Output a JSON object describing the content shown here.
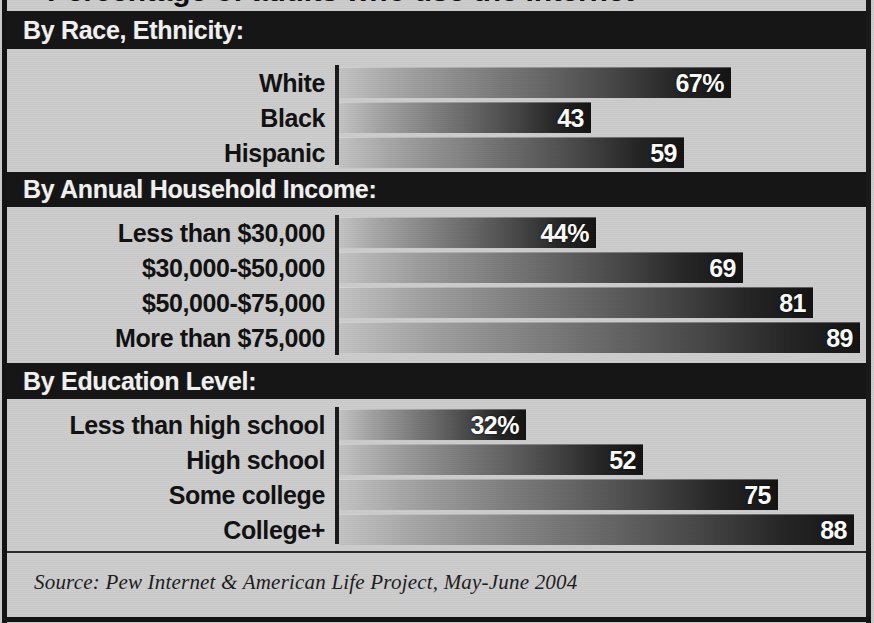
{
  "title": "Percentage of adults who use the Internet",
  "sections": [
    {
      "id": "race",
      "header": "By Race, Ethnicity:"
    },
    {
      "id": "income",
      "header": "By Annual Household Income:"
    },
    {
      "id": "education",
      "header": "By Education Level:"
    }
  ],
  "source": "Source: Pew Internet & American Life Project, May-June 2004",
  "colors": {
    "panel_background": "#cdcdcd",
    "band_background": "#161616",
    "band_text": "#f2f2f2",
    "label_text": "#121212",
    "bar_gradient_start": "#c4c4c4",
    "bar_gradient_end": "#141414",
    "bar_value_text": "#ffffff",
    "axis": "#1b1b1b"
  },
  "chart_data": {
    "type": "bar",
    "title": "Percentage of adults who use the Internet",
    "xlabel": "",
    "ylabel": "",
    "xlim": [
      0,
      100
    ],
    "grid": false,
    "orientation": "horizontal",
    "legend": "none",
    "value_unit": "percent",
    "groups": [
      {
        "name": "By Race, Ethnicity:",
        "categories": [
          "White",
          "Black",
          "Hispanic"
        ],
        "values": [
          67,
          43,
          59
        ],
        "labels": [
          "67%",
          "43",
          "59"
        ]
      },
      {
        "name": "By Annual Household Income:",
        "categories": [
          "Less than $30,000",
          "$30,000-$50,000",
          "$50,000-$75,000",
          "More than $75,000"
        ],
        "values": [
          44,
          69,
          81,
          89
        ],
        "labels": [
          "44%",
          "69",
          "81",
          "89"
        ]
      },
      {
        "name": "By Education Level:",
        "categories": [
          "Less than high school",
          "High school",
          "Some college",
          "College+"
        ],
        "values": [
          32,
          52,
          75,
          88
        ],
        "labels": [
          "32%",
          "52",
          "75",
          "88"
        ]
      }
    ],
    "source": "Source: Pew Internet & American Life Project, May-June 2004"
  }
}
